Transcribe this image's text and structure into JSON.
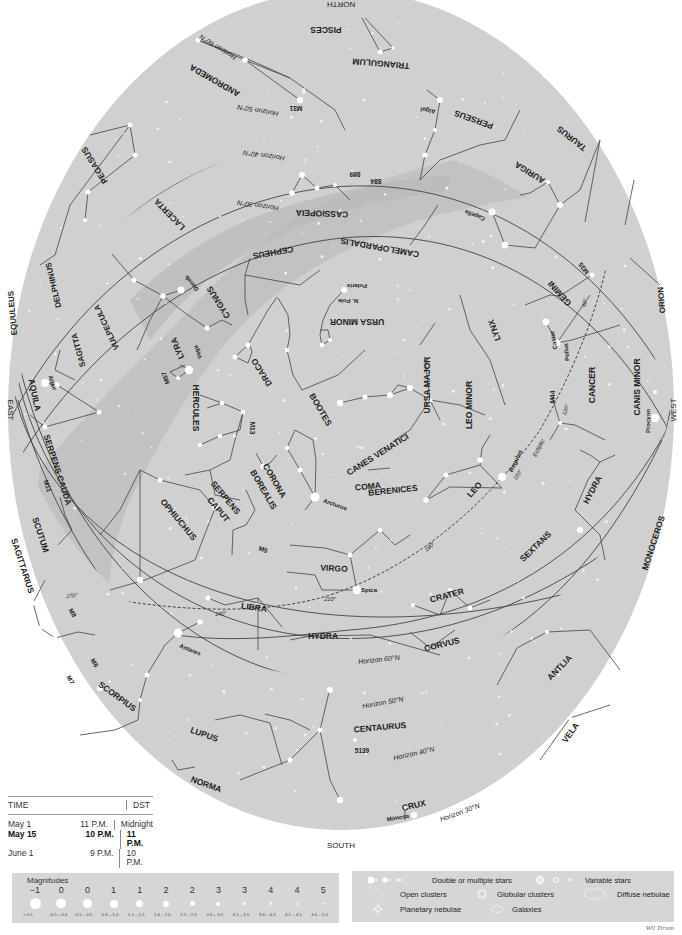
{
  "chart": {
    "directions": {
      "north": "NORTH",
      "south": "SOUTH",
      "east": "EAST",
      "west": "WEST"
    },
    "colors": {
      "sky": "#d0d0d0",
      "milky_way": "#c2c2c2",
      "milky_way_light": "#dadada",
      "lines": "#444444",
      "stars": "#ffffff",
      "text": "#222222"
    },
    "constellations": [
      {
        "name": "PISCES",
        "x": 326,
        "y": 29,
        "rot": 180,
        "size": 8.5
      },
      {
        "name": "TRIANGULUM",
        "x": 381,
        "y": 63,
        "rot": 185,
        "size": 8.5
      },
      {
        "name": "ANDROMEDA",
        "x": 215,
        "y": 80,
        "rot": 210,
        "size": 8.5
      },
      {
        "name": "PERSEUS",
        "x": 474,
        "y": 119,
        "rot": 200,
        "size": 8.5
      },
      {
        "name": "PEGASUS",
        "x": 95,
        "y": 165,
        "rot": 238,
        "size": 8.5
      },
      {
        "name": "TAURUS",
        "x": 572,
        "y": 138,
        "rot": 218,
        "size": 8.5
      },
      {
        "name": "AURIGA",
        "x": 530,
        "y": 172,
        "rot": 212,
        "size": 8.5
      },
      {
        "name": "CASSIOPEIA",
        "x": 322,
        "y": 213,
        "rot": 182,
        "size": 8.5
      },
      {
        "name": "LACERTA",
        "x": 170,
        "y": 214,
        "rot": 226,
        "size": 8.5
      },
      {
        "name": "CAMELOPARDALIS",
        "x": 380,
        "y": 247,
        "rot": 190,
        "size": 8.5
      },
      {
        "name": "CEPHEUS",
        "x": 273,
        "y": 252,
        "rot": 170,
        "size": 8.5
      },
      {
        "name": "DELPHINUS",
        "x": 54,
        "y": 285,
        "rot": 257,
        "size": 8
      },
      {
        "name": "CYGNUS",
        "x": 219,
        "y": 302,
        "rot": 238,
        "size": 8.5
      },
      {
        "name": "GEMINI",
        "x": 560,
        "y": 293,
        "rot": 228,
        "size": 8.5
      },
      {
        "name": "ORION",
        "x": 662,
        "y": 300,
        "rot": 265,
        "size": 8
      },
      {
        "name": "URSA MINOR",
        "x": 357,
        "y": 321,
        "rot": 180,
        "size": 8.5
      },
      {
        "name": "VULPECULA",
        "x": 107,
        "y": 327,
        "rot": 245,
        "size": 8
      },
      {
        "name": "EQUULEUS",
        "x": 13,
        "y": 313,
        "rot": 265,
        "size": 8
      },
      {
        "name": "SAGITTA",
        "x": 79,
        "y": 350,
        "rot": 255,
        "size": 8
      },
      {
        "name": "LYRA",
        "x": 178,
        "y": 348,
        "rot": 248,
        "size": 8.5
      },
      {
        "name": "DRACO",
        "x": 262,
        "y": 372,
        "rot": 238,
        "size": 8.5
      },
      {
        "name": "LYNX",
        "x": 495,
        "y": 330,
        "rot": 250,
        "size": 8.5
      },
      {
        "name": "URSA MAJOR",
        "x": 428,
        "y": 385,
        "rot": 270,
        "size": 8.5
      },
      {
        "name": "LEO MINOR",
        "x": 470,
        "y": 405,
        "rot": 270,
        "size": 8.5
      },
      {
        "name": "CANCER",
        "x": 593,
        "y": 385,
        "rot": 270,
        "size": 8.5
      },
      {
        "name": "CANIS MINOR",
        "x": 638,
        "y": 387,
        "rot": 270,
        "size": 8.5
      },
      {
        "name": "AQUILA",
        "x": 34,
        "y": 395,
        "rot": 78,
        "size": 8.5
      },
      {
        "name": "HERCULES",
        "x": 195,
        "y": 408,
        "rot": 90,
        "size": 8.5
      },
      {
        "name": "BOOTES",
        "x": 320,
        "y": 410,
        "rot": 60,
        "size": 8.5
      },
      {
        "name": "CANES VENATICI",
        "x": 378,
        "y": 455,
        "rot": -32,
        "size": 8.5
      },
      {
        "name": "SERPENS CAUDA",
        "x": 57,
        "y": 470,
        "rot": 72,
        "size": 8.5
      },
      {
        "name": "CORONA",
        "x": 274,
        "y": 481,
        "rot": 60,
        "size": 8.5
      },
      {
        "name": "BOREALIS",
        "x": 263,
        "y": 490,
        "rot": 60,
        "size": 8.5
      },
      {
        "name": "COMA",
        "x": 368,
        "y": 487,
        "rot": -6,
        "size": 8.5
      },
      {
        "name": "BERENICES",
        "x": 393,
        "y": 491,
        "rot": -6,
        "size": 8.5
      },
      {
        "name": "LEO",
        "x": 475,
        "y": 490,
        "rot": -48,
        "size": 8.5
      },
      {
        "name": "HYDRA",
        "x": 593,
        "y": 490,
        "rot": -62,
        "size": 8.5
      },
      {
        "name": "SERPENS",
        "x": 225,
        "y": 498,
        "rot": 50,
        "size": 8.5
      },
      {
        "name": "CAPUT",
        "x": 218,
        "y": 510,
        "rot": 50,
        "size": 8.5
      },
      {
        "name": "MONOCEROS",
        "x": 654,
        "y": 543,
        "rot": -72,
        "size": 8.5
      },
      {
        "name": "OPHIUCHUS",
        "x": 178,
        "y": 520,
        "rot": 50,
        "size": 8.5
      },
      {
        "name": "SCUTUM",
        "x": 40,
        "y": 535,
        "rot": 72,
        "size": 8.5
      },
      {
        "name": "SEXTANS",
        "x": 536,
        "y": 547,
        "rot": -44,
        "size": 8.5
      },
      {
        "name": "VIRGO",
        "x": 334,
        "y": 569,
        "rot": 3,
        "size": 8.5
      },
      {
        "name": "SAGITTARIUS",
        "x": 22,
        "y": 566,
        "rot": 72,
        "size": 8.5
      },
      {
        "name": "CRATER",
        "x": 447,
        "y": 596,
        "rot": -15,
        "size": 8.5
      },
      {
        "name": "LIBRA",
        "x": 254,
        "y": 608,
        "rot": 8,
        "size": 8.5
      },
      {
        "name": "HYDRA",
        "x": 323,
        "y": 637,
        "rot": 0,
        "size": 8.5
      },
      {
        "name": "CORVUS",
        "x": 442,
        "y": 645,
        "rot": -14,
        "size": 8.5
      },
      {
        "name": "ANTLIA",
        "x": 560,
        "y": 668,
        "rot": -46,
        "size": 8.5
      },
      {
        "name": "SCORPIUS",
        "x": 117,
        "y": 697,
        "rot": 36,
        "size": 8.5
      },
      {
        "name": "LUPUS",
        "x": 204,
        "y": 735,
        "rot": 20,
        "size": 8.5
      },
      {
        "name": "CENTAURUS",
        "x": 380,
        "y": 728,
        "rot": -5,
        "size": 8.5
      },
      {
        "name": "VELA",
        "x": 571,
        "y": 733,
        "rot": -54,
        "size": 8.5
      },
      {
        "name": "NORMA",
        "x": 206,
        "y": 785,
        "rot": 20,
        "size": 8.5
      },
      {
        "name": "CRUX",
        "x": 414,
        "y": 806,
        "rot": -14,
        "size": 8.5
      }
    ],
    "star_names": [
      {
        "name": "Algol",
        "x": 428,
        "y": 110,
        "rot": 190
      },
      {
        "name": "Capella",
        "x": 475,
        "y": 215,
        "rot": 200
      },
      {
        "name": "Deneb",
        "x": 192,
        "y": 283,
        "rot": 230
      },
      {
        "name": "Polaris",
        "x": 357,
        "y": 286,
        "rot": 180
      },
      {
        "name": "N. Pole",
        "x": 348,
        "y": 301,
        "rot": 180
      },
      {
        "name": "Castor",
        "x": 554,
        "y": 340,
        "rot": 260
      },
      {
        "name": "Pollux",
        "x": 567,
        "y": 352,
        "rot": 264
      },
      {
        "name": "Vega",
        "x": 198,
        "y": 352,
        "rot": 250
      },
      {
        "name": "Altair",
        "x": 52,
        "y": 383,
        "rot": 72
      },
      {
        "name": "Procyon",
        "x": 648,
        "y": 421,
        "rot": 270
      },
      {
        "name": "Regulus",
        "x": 516,
        "y": 461,
        "rot": -65
      },
      {
        "name": "Arcturus",
        "x": 335,
        "y": 505,
        "rot": 20
      },
      {
        "name": "Spica",
        "x": 369,
        "y": 590,
        "rot": 0
      },
      {
        "name": "Antares",
        "x": 190,
        "y": 650,
        "rot": 22
      },
      {
        "name": "Mimosa",
        "x": 398,
        "y": 818,
        "rot": -10
      }
    ],
    "deep_sky": [
      {
        "name": "M31",
        "x": 296,
        "y": 108,
        "rot": 180
      },
      {
        "name": "869",
        "x": 355,
        "y": 174,
        "rot": 180
      },
      {
        "name": "884",
        "x": 376,
        "y": 181,
        "rot": 180
      },
      {
        "name": "M35",
        "x": 584,
        "y": 268,
        "rot": 232
      },
      {
        "name": "M57",
        "x": 166,
        "y": 378,
        "rot": 250
      },
      {
        "name": "M13",
        "x": 252,
        "y": 428,
        "rot": 90
      },
      {
        "name": "M44",
        "x": 553,
        "y": 397,
        "rot": 270
      },
      {
        "name": "M11",
        "x": 47,
        "y": 486,
        "rot": 72
      },
      {
        "name": "M5",
        "x": 263,
        "y": 550,
        "rot": 20
      },
      {
        "name": "M8",
        "x": 72,
        "y": 613,
        "rot": 60
      },
      {
        "name": "M6",
        "x": 94,
        "y": 663,
        "rot": 60
      },
      {
        "name": "M7",
        "x": 70,
        "y": 680,
        "rot": 60
      },
      {
        "name": "5139",
        "x": 362,
        "y": 751,
        "rot": 0
      }
    ],
    "horizons": [
      {
        "label": "Horizon 60°N",
        "x": 218,
        "y": 47,
        "rot": 212
      },
      {
        "label": "Horizon 50°N",
        "x": 258,
        "y": 110,
        "rot": 190
      },
      {
        "label": "Horizon 40°N",
        "x": 264,
        "y": 155,
        "rot": 188
      },
      {
        "label": "Horizon 30°N",
        "x": 258,
        "y": 205,
        "rot": 188
      },
      {
        "label": "Horizon 60°N",
        "x": 379,
        "y": 660,
        "rot": -6
      },
      {
        "label": "Horizon 50°N",
        "x": 383,
        "y": 703,
        "rot": -10
      },
      {
        "label": "Horizon 40°N",
        "x": 414,
        "y": 754,
        "rot": -13
      },
      {
        "label": "Horizon 30°N",
        "x": 460,
        "y": 813,
        "rot": -20
      }
    ],
    "ecliptic": {
      "label": "Ecliptic",
      "x": 539,
      "y": 448,
      "rot": -62,
      "marks": [
        {
          "label": "270°",
          "x": 72,
          "y": 596,
          "rot": -8
        },
        {
          "label": "240°",
          "x": 221,
          "y": 614,
          "rot": -6
        },
        {
          "label": "210°",
          "x": 330,
          "y": 600,
          "rot": 0
        },
        {
          "label": "180°",
          "x": 430,
          "y": 547,
          "rot": -40
        },
        {
          "label": "150°",
          "x": 518,
          "y": 475,
          "rot": -55
        },
        {
          "label": "120°",
          "x": 566,
          "y": 410,
          "rot": -70
        },
        {
          "label": "90°",
          "x": 585,
          "y": 303,
          "rot": -80
        }
      ]
    }
  },
  "time_table": {
    "headers": [
      "TIME",
      "DST"
    ],
    "rows": [
      {
        "date": "May 1",
        "time": "11 P.M.",
        "dst": "Midnight",
        "bold": false
      },
      {
        "date": "May 15",
        "time": "10 P.M.",
        "dst": "11 P.M.",
        "bold": true
      },
      {
        "date": "June 1",
        "time": "9 P.M.",
        "dst": "10 P.M.",
        "bold": false
      }
    ]
  },
  "magnitudes": {
    "title": "Magnitudes",
    "items": [
      {
        "mag": "−1",
        "range": "> 0.5",
        "size": 11
      },
      {
        "mag": "0",
        "range": "-0.5 – 0.0",
        "size": 9.5
      },
      {
        "mag": "0",
        "range": "0.1 – 0.5",
        "size": 8.5
      },
      {
        "mag": "1",
        "range": "0.6 – 1.0",
        "size": 8
      },
      {
        "mag": "1",
        "range": "1.1 – 1.5",
        "size": 7
      },
      {
        "mag": "2",
        "range": "1.6 – 2.0",
        "size": 6
      },
      {
        "mag": "2",
        "range": "2.1 – 2.5",
        "size": 5
      },
      {
        "mag": "3",
        "range": "2.6 – 3.0",
        "size": 4
      },
      {
        "mag": "3",
        "range": "3.1 – 3.5",
        "size": 3.2
      },
      {
        "mag": "4",
        "range": "3.6 – 4.0",
        "size": 2.6
      },
      {
        "mag": "4",
        "range": "4.1 – 4.5",
        "size": 2
      },
      {
        "mag": "5",
        "range": "4.6 – 5.0",
        "size": 1.4
      }
    ]
  },
  "legend": {
    "double_stars": "Double or multiple stars",
    "variable_stars": "Variable stars",
    "open_clusters": "Open clusters",
    "globular_clusters": "Globular clusters",
    "diffuse_nebulae": "Diffuse nebulae",
    "planetary_nebulae": "Planetary nebulae",
    "galaxies": "Galaxies"
  },
  "signature": "Wil Tirion"
}
